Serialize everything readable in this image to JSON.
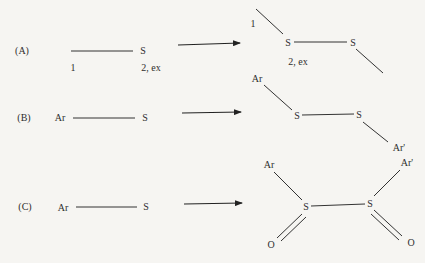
{
  "diagram": {
    "type": "reaction-scheme",
    "rows": [
      {
        "id": "A",
        "label": "(A)",
        "reactant": {
          "atoms": [
            "S"
          ],
          "annotations": [
            "1",
            "2, ex"
          ]
        },
        "product": {
          "atoms": [
            "S",
            "S"
          ],
          "annotations": [
            "1",
            "2, ex"
          ]
        }
      },
      {
        "id": "B",
        "label": "(B)",
        "reactant": {
          "atoms": [
            "Ar",
            "S"
          ]
        },
        "product": {
          "atoms": [
            "Ar",
            "S",
            "S",
            "Ar'"
          ]
        }
      },
      {
        "id": "C",
        "label": "(C)",
        "reactant": {
          "atoms": [
            "Ar",
            "S"
          ]
        },
        "product": {
          "atoms": [
            "Ar",
            "Ar'",
            "S",
            "S",
            "O",
            "O"
          ]
        }
      }
    ],
    "colors": {
      "ink": "#2e2e2e",
      "paper": "#f6f5f2"
    }
  }
}
